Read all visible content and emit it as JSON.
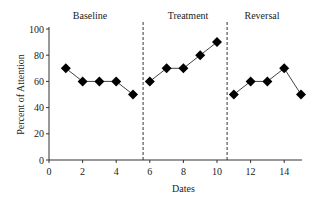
{
  "chart_data": {
    "type": "line",
    "title": "",
    "xlabel": "Dates",
    "ylabel": "Percent of Attention",
    "xlim": [
      0,
      15
    ],
    "ylim": [
      0,
      100
    ],
    "x_ticks": [
      0,
      2,
      4,
      6,
      8,
      10,
      12,
      14
    ],
    "y_ticks": [
      0,
      20,
      40,
      60,
      80,
      100
    ],
    "grid": false,
    "marker": "diamond",
    "phase_lines": [
      5.6,
      10.6
    ],
    "phases": [
      {
        "label": "Baseline",
        "x": [
          1,
          2,
          3,
          4,
          5
        ],
        "y": [
          70,
          60,
          60,
          60,
          50
        ]
      },
      {
        "label": "Treatment",
        "x": [
          6,
          7,
          8,
          9,
          10
        ],
        "y": [
          60,
          70,
          70,
          80,
          90
        ]
      },
      {
        "label": "Reversal",
        "x": [
          11,
          12,
          13,
          14,
          15
        ],
        "y": [
          50,
          60,
          60,
          70,
          50
        ]
      }
    ]
  },
  "labels": {
    "phase_baseline": "Baseline",
    "phase_treatment": "Treatment",
    "phase_reversal": "Reversal",
    "xlabel": "Dates",
    "ylabel": "Percent of Attention"
  }
}
